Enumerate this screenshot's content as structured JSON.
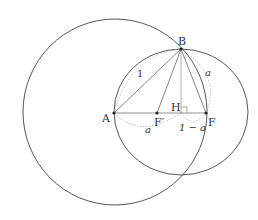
{
  "diagram": {
    "type": "geometry",
    "points": {
      "A": {
        "label": "A",
        "x": 114,
        "y": 113
      },
      "B": {
        "label": "B",
        "x": 181,
        "y": 49
      },
      "F_prime": {
        "label": "F′",
        "x": 157,
        "y": 113
      },
      "H": {
        "label": "H",
        "x": 181,
        "y": 113
      },
      "F": {
        "label": "F",
        "x": 206,
        "y": 113
      }
    },
    "circles": [
      {
        "name": "large-circle",
        "cx": 115,
        "cy": 112,
        "rx": 92,
        "ry": 93
      },
      {
        "name": "right-circle",
        "cx": 181,
        "cy": 112,
        "rx": 67,
        "ry": 63
      }
    ],
    "segment_labels": {
      "AB": "1",
      "BF": "a",
      "AF_prime": "a",
      "HF": "1 − a"
    },
    "right_angle_at": "H",
    "colors": {
      "line": "#444444",
      "dotted": "#aaaaaa",
      "text": "#333333"
    }
  }
}
